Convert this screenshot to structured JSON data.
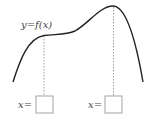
{
  "diagram": {
    "curve_label": "y=f(x)",
    "inputs": [
      {
        "label": "x=",
        "value": ""
      },
      {
        "label": "x=",
        "value": ""
      }
    ],
    "colors": {
      "curve": "#222222",
      "guide": "#888888",
      "box": "#999999",
      "text": "#444444"
    }
  }
}
